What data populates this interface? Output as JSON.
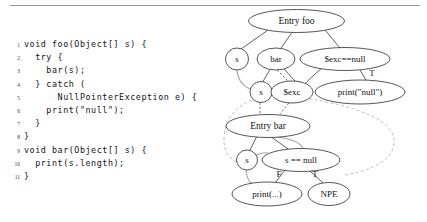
{
  "figure": {
    "name": "code-and-exception-cfg",
    "rule": "horizontal-rule"
  },
  "code": {
    "lines": [
      {
        "n": "1",
        "text": "void foo(Object[] s) {"
      },
      {
        "n": "2",
        "text": "  try {"
      },
      {
        "n": "3",
        "text": "    bar(s);"
      },
      {
        "n": "4",
        "text": "  } catch ("
      },
      {
        "n": "5",
        "text": "      NullPointerException e) {"
      },
      {
        "n": "6",
        "text": "    print(\"null\");"
      },
      {
        "n": "7",
        "text": "  }"
      },
      {
        "n": "8",
        "text": "}"
      },
      {
        "n": "9",
        "text": "void bar(Object[] s) {"
      },
      {
        "n": "10",
        "text": "  print(s.length);"
      },
      {
        "n": "11",
        "text": "}"
      }
    ]
  },
  "graph": {
    "nodes": [
      {
        "id": "entry_foo",
        "label": "Entry foo",
        "cx": 296.5,
        "cy": 21,
        "rx": 48,
        "ry": 11.5,
        "size": "big"
      },
      {
        "id": "s_foo",
        "label": "s",
        "cx": 237,
        "cy": 59,
        "rx": 11.5,
        "ry": 11.0,
        "size": "mid"
      },
      {
        "id": "bar",
        "label": "bar",
        "cx": 276,
        "cy": 59,
        "rx": 19,
        "ry": 11.0,
        "size": "mid"
      },
      {
        "id": "exc_is_null",
        "label": "$exc==null",
        "cx": 345,
        "cy": 59,
        "rx": 45,
        "ry": 11.5,
        "size": "mid"
      },
      {
        "id": "s_call",
        "label": "s",
        "cx": 261,
        "cy": 92,
        "rx": 11,
        "ry": 10.5,
        "size": "mid"
      },
      {
        "id": "exc",
        "label": "$exc",
        "cx": 292,
        "cy": 92,
        "rx": 21,
        "ry": 11.0,
        "size": "mid"
      },
      {
        "id": "print_null",
        "label": "print(\"null\")",
        "cx": 360,
        "cy": 92,
        "rx": 45,
        "ry": 12.0,
        "size": "mid"
      },
      {
        "id": "entry_bar",
        "label": "Entry bar",
        "cx": 268,
        "cy": 126,
        "rx": 42,
        "ry": 11.5,
        "size": "big"
      },
      {
        "id": "s_bar",
        "label": "s",
        "cx": 247,
        "cy": 160,
        "rx": 10.5,
        "ry": 10.0,
        "size": "mid"
      },
      {
        "id": "s_eq_null",
        "label": "s == null",
        "cx": 301,
        "cy": 160,
        "rx": 39,
        "ry": 11.5,
        "size": "mid"
      },
      {
        "id": "print_dots",
        "label": "print(...)",
        "cx": 267,
        "cy": 194,
        "rx": 35,
        "ry": 12.0,
        "size": "mid"
      },
      {
        "id": "npe",
        "label": "NPE",
        "cx": 329,
        "cy": 194,
        "rx": 21,
        "ry": 11.5,
        "size": "mid"
      }
    ],
    "edge_labels": [
      {
        "id": "t_exc",
        "text": "T",
        "x": 372,
        "y": 74
      },
      {
        "id": "f_cond",
        "text": "F",
        "x": 279,
        "y": 175
      },
      {
        "id": "t_cond",
        "text": "T",
        "x": 315,
        "y": 175
      }
    ],
    "edges": [
      {
        "id": "entry_foo-s_foo",
        "kind": "solid",
        "d": "M 268,30 L 241,49"
      },
      {
        "id": "entry_foo-bar",
        "kind": "solid",
        "d": "M 292,32.5 L 281,48"
      },
      {
        "id": "entry_foo-exc_is_null",
        "kind": "solid",
        "d": "M 325,30 L 340,48"
      },
      {
        "id": "bar-s_call",
        "kind": "solid",
        "d": "M 270,69.5 L 263,81.5"
      },
      {
        "id": "bar-exc",
        "kind": "dash",
        "d": "M 277,70 L 288,81"
      },
      {
        "id": "bar-exc2",
        "kind": "solid",
        "d": "M 284,69 L 295,81"
      },
      {
        "id": "exc_is_null-exc",
        "kind": "solid",
        "d": "M 322,68 Q 310,78 304,85"
      },
      {
        "id": "exc_is_null-print_null",
        "kind": "solid",
        "d": "M 360,70 L 366,80"
      },
      {
        "id": "s_foo-s_call",
        "kind": "gray",
        "d": "M 237,70 Q 238,84 250,89"
      },
      {
        "id": "s_call-entry_bar",
        "kind": "dash",
        "d": "M 260,102.5 L 260,114"
      },
      {
        "id": "exc-entry_bar",
        "kind": "dash",
        "d": "M 289,103 Q 284,109 280,114"
      },
      {
        "id": "entry_bar-s_bar",
        "kind": "solid",
        "d": "M 257,136 L 250,150"
      },
      {
        "id": "entry_bar-s_eq_null",
        "kind": "solid",
        "d": "M 272,137.5 L 288,149"
      },
      {
        "id": "entry_bar-s_eq_null2",
        "kind": "gray",
        "d": "M 277,137 Q 299,140 303,148"
      },
      {
        "id": "s_bar-s_eq_null",
        "kind": "gray",
        "d": "M 256,155 Q 264,152 268,153"
      },
      {
        "id": "s_bar-print_dots",
        "kind": "gray",
        "d": "M 246,170 Q 247,180 252,184"
      },
      {
        "id": "s_eq_null-print_dots",
        "kind": "solid",
        "d": "M 285,170 L 275,183"
      },
      {
        "id": "s_eq_null-npe",
        "kind": "solid",
        "d": "M 310,171 L 323,183"
      },
      {
        "id": "dash-left-loop",
        "kind": "graydash",
        "d": "M 252,100 Q 224,112 224,140 Q 224,160 244,164"
      },
      {
        "id": "dash-right-loop",
        "kind": "graydash",
        "d": "M 345,175 Q 395,166 394,140 Q 392,112 305,98"
      }
    ]
  }
}
